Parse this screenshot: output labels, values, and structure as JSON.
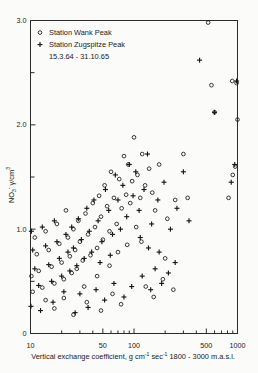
{
  "chart_data": {
    "type": "scatter",
    "title": "",
    "xlabel": "Vertical exchange coefficient, g cm⁻¹ sec⁻¹ 1800-3000 m.a.s.l.",
    "ylabel": "NO3⁻ γ/cm³",
    "xscale": "log",
    "xlim": [
      10,
      1000
    ],
    "ylim": [
      0,
      3.0
    ],
    "grid": false,
    "legend_position": "top-left",
    "x_ticks": [
      10,
      50,
      100,
      500,
      1000
    ],
    "x_tick_labels": [
      "10",
      "50",
      "100",
      "500",
      "1000"
    ],
    "x_minor_ticks": [
      20,
      30,
      40,
      60,
      70,
      80,
      90,
      200,
      300,
      400,
      600,
      700,
      800,
      900
    ],
    "y_ticks": [
      0,
      1.0,
      2.0,
      3.0
    ],
    "y_tick_labels": [
      "0",
      "1.0",
      "2.0",
      "3.0"
    ],
    "y_minor_ticks": [
      0.5,
      1.5,
      2.5
    ],
    "series": [
      {
        "name": "Station Wank Peak",
        "marker": "circle",
        "points": [
          [
            520,
            2.98
          ],
          [
            560,
            2.38
          ],
          [
            600,
            2.12
          ],
          [
            890,
            2.42
          ],
          [
            980,
            2.4
          ],
          [
            950,
            1.6
          ],
          [
            900,
            1.52
          ],
          [
            820,
            1.3
          ],
          [
            1000,
            2.05
          ],
          [
            300,
            1.72
          ],
          [
            330,
            1.3
          ],
          [
            250,
            1.28
          ],
          [
            210,
            1.1
          ],
          [
            175,
            1.62
          ],
          [
            150,
            1.35
          ],
          [
            160,
            1.18
          ],
          [
            140,
            1.58
          ],
          [
            128,
            1.42
          ],
          [
            120,
            1.72
          ],
          [
            115,
            1.3
          ],
          [
            108,
            1.52
          ],
          [
            100,
            1.88
          ],
          [
            96,
            1.46
          ],
          [
            92,
            1.25
          ],
          [
            88,
            1.62
          ],
          [
            84,
            1.33
          ],
          [
            80,
            1.7
          ],
          [
            76,
            1.2
          ],
          [
            72,
            1.48
          ],
          [
            68,
            1.05
          ],
          [
            64,
            1.3
          ],
          [
            60,
            1.55
          ],
          [
            58,
            0.98
          ],
          [
            55,
            1.22
          ],
          [
            52,
            1.42
          ],
          [
            50,
            0.9
          ],
          [
            48,
            1.12
          ],
          [
            46,
            1.32
          ],
          [
            44,
            0.82
          ],
          [
            42,
            1.02
          ],
          [
            40,
            1.25
          ],
          [
            38,
            0.75
          ],
          [
            36,
            0.95
          ],
          [
            34,
            1.15
          ],
          [
            32,
            0.7
          ],
          [
            30,
            0.88
          ],
          [
            29,
            1.08
          ],
          [
            28,
            0.62
          ],
          [
            27,
            0.8
          ],
          [
            26,
            1.0
          ],
          [
            25,
            0.58
          ],
          [
            24,
            0.74
          ],
          [
            23,
            0.92
          ],
          [
            22,
            1.18
          ],
          [
            21,
            0.52
          ],
          [
            20,
            0.68
          ],
          [
            19,
            0.86
          ],
          [
            18,
            1.05
          ],
          [
            17,
            0.48
          ],
          [
            16,
            0.64
          ],
          [
            15,
            0.8
          ],
          [
            14,
            0.98
          ],
          [
            13,
            0.44
          ],
          [
            12,
            0.6
          ],
          [
            11.5,
            0.76
          ],
          [
            11,
            0.92
          ],
          [
            10.5,
            0.4
          ],
          [
            10.2,
            0.55
          ],
          [
            35,
            0.3
          ],
          [
            48,
            0.22
          ],
          [
            62,
            0.38
          ],
          [
            75,
            0.28
          ],
          [
            130,
            0.45
          ],
          [
            155,
            0.35
          ],
          [
            190,
            0.52
          ],
          [
            240,
            0.42
          ],
          [
            17,
            0.24
          ],
          [
            21,
            0.34
          ],
          [
            26,
            0.18
          ],
          [
            14,
            0.32
          ],
          [
            105,
            1.02
          ],
          [
            118,
            0.88
          ],
          [
            86,
            0.85
          ],
          [
            70,
            0.78
          ],
          [
            58,
            0.65
          ],
          [
            44,
            0.55
          ],
          [
            33,
            0.45
          ],
          [
            200,
            0.72
          ]
        ]
      },
      {
        "name": "Station Zugspitze Peak",
        "marker": "plus",
        "points": [
          [
            430,
            2.62
          ],
          [
            600,
            2.12
          ],
          [
            980,
            2.42
          ],
          [
            940,
            1.62
          ],
          [
            870,
            1.45
          ],
          [
            300,
            1.55
          ],
          [
            340,
            1.08
          ],
          [
            260,
            1.2
          ],
          [
            225,
            1.0
          ],
          [
            195,
            1.45
          ],
          [
            170,
            1.28
          ],
          [
            148,
            1.05
          ],
          [
            135,
            1.72
          ],
          [
            125,
            1.38
          ],
          [
            112,
            1.18
          ],
          [
            104,
            1.55
          ],
          [
            98,
            1.32
          ],
          [
            90,
            1.62
          ],
          [
            85,
            1.12
          ],
          [
            78,
            1.42
          ],
          [
            74,
            1.0
          ],
          [
            70,
            1.28
          ],
          [
            66,
            1.52
          ],
          [
            62,
            0.95
          ],
          [
            57,
            1.18
          ],
          [
            53,
            1.38
          ],
          [
            49,
            0.88
          ],
          [
            45,
            1.08
          ],
          [
            41,
            1.28
          ],
          [
            39,
            0.78
          ],
          [
            37,
            0.98
          ],
          [
            35,
            1.2
          ],
          [
            33,
            0.72
          ],
          [
            31,
            0.9
          ],
          [
            29,
            1.1
          ],
          [
            28,
            0.65
          ],
          [
            26,
            0.82
          ],
          [
            25,
            1.02
          ],
          [
            24,
            0.6
          ],
          [
            23,
            0.78
          ],
          [
            22,
            0.95
          ],
          [
            20,
            0.55
          ],
          [
            19,
            0.72
          ],
          [
            18,
            0.88
          ],
          [
            17,
            1.08
          ],
          [
            16,
            0.5
          ],
          [
            15,
            0.66
          ],
          [
            14,
            0.84
          ],
          [
            13,
            1.02
          ],
          [
            12,
            0.46
          ],
          [
            11,
            0.62
          ],
          [
            10.5,
            0.8
          ],
          [
            10.2,
            0.98
          ],
          [
            10.1,
            0.26
          ],
          [
            160,
            0.62
          ],
          [
            185,
            0.48
          ],
          [
            215,
            0.58
          ],
          [
            145,
            0.42
          ],
          [
            120,
            0.55
          ],
          [
            95,
            0.45
          ],
          [
            80,
            0.35
          ],
          [
            64,
            0.48
          ],
          [
            52,
            0.32
          ],
          [
            43,
            0.42
          ],
          [
            36,
            0.25
          ],
          [
            30,
            0.38
          ],
          [
            27,
            0.2
          ],
          [
            21,
            0.4
          ],
          [
            16.5,
            0.3
          ],
          [
            12.5,
            0.22
          ],
          [
            115,
            0.92
          ],
          [
            138,
            0.82
          ],
          [
            175,
            0.78
          ],
          [
            250,
            0.68
          ],
          [
            47,
            0.68
          ],
          [
            59,
            0.75
          ]
        ]
      }
    ],
    "annotation": "15.3.64 - 31.10.65"
  },
  "legend": {
    "entry1": "Station Wank Peak",
    "entry2": "Station Zugspitze Peak",
    "daterange": "15.3.64 - 31.10.65"
  },
  "axis": {
    "y_label_main": "NO",
    "y_label_sub": "3",
    "y_label_sup": "-",
    "y_label_unit": "γ/cm",
    "y_label_unit_sup": "3",
    "x_label_p1": "Vertical exchange coefficient, g cm",
    "x_label_s1": "-1",
    "x_label_p2": " sec",
    "x_label_s2": "-1",
    "x_label_p3": "1800 - 3000 m.a.s.l."
  }
}
